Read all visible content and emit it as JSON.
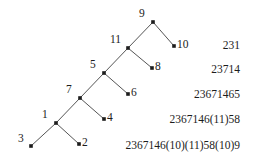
{
  "figure": {
    "kind": "binary-tree-diagram",
    "width": 258,
    "height": 161,
    "background": "#ffffff",
    "ink_color": "#1c1c1c",
    "edge_color": "#555555",
    "node_marker": "filled-square-dot"
  },
  "tree": {
    "nodes": [
      {
        "id": "n9",
        "label": "9",
        "x": 153,
        "y": 22,
        "label_x": 139,
        "label_y": 8,
        "label_side": "left-above"
      },
      {
        "id": "n11",
        "label": "11",
        "x": 128,
        "y": 48,
        "label_x": 110,
        "label_y": 34,
        "label_side": "left-above"
      },
      {
        "id": "n10",
        "label": "10",
        "x": 174,
        "y": 46,
        "label_x": 177,
        "label_y": 39,
        "label_side": "right"
      },
      {
        "id": "n5",
        "label": "5",
        "x": 104,
        "y": 73,
        "label_x": 90,
        "label_y": 59,
        "label_side": "left-above"
      },
      {
        "id": "n8",
        "label": "8",
        "x": 152,
        "y": 68,
        "label_x": 155,
        "label_y": 61,
        "label_side": "right"
      },
      {
        "id": "n7",
        "label": "7",
        "x": 80,
        "y": 98,
        "label_x": 66,
        "label_y": 84,
        "label_side": "left-above"
      },
      {
        "id": "n6",
        "label": "6",
        "x": 128,
        "y": 94,
        "label_x": 131,
        "label_y": 87,
        "label_side": "right"
      },
      {
        "id": "n1",
        "label": "1",
        "x": 56,
        "y": 123,
        "label_x": 42,
        "label_y": 109,
        "label_side": "left-above"
      },
      {
        "id": "n4",
        "label": "4",
        "x": 104,
        "y": 119,
        "label_x": 107,
        "label_y": 112,
        "label_side": "right"
      },
      {
        "id": "n3",
        "label": "3",
        "x": 31,
        "y": 146,
        "label_x": 18,
        "label_y": 133,
        "label_side": "left"
      },
      {
        "id": "n2",
        "label": "2",
        "x": 79,
        "y": 144,
        "label_x": 82,
        "label_y": 137,
        "label_side": "right"
      }
    ],
    "edges": [
      {
        "from": "n9",
        "to": "n11"
      },
      {
        "from": "n9",
        "to": "n10"
      },
      {
        "from": "n11",
        "to": "n5"
      },
      {
        "from": "n11",
        "to": "n8"
      },
      {
        "from": "n5",
        "to": "n7"
      },
      {
        "from": "n5",
        "to": "n6"
      },
      {
        "from": "n7",
        "to": "n1"
      },
      {
        "from": "n7",
        "to": "n4"
      },
      {
        "from": "n1",
        "to": "n3"
      },
      {
        "from": "n1",
        "to": "n2"
      }
    ]
  },
  "codes": [
    {
      "text": "231",
      "x": 240,
      "y": 39
    },
    {
      "text": "23714",
      "x": 240,
      "y": 63
    },
    {
      "text": "23671465",
      "x": 240,
      "y": 88
    },
    {
      "text": "2367146(11)58",
      "x": 240,
      "y": 113
    },
    {
      "text": "2367146(10)(11)58(10)9",
      "x": 240,
      "y": 139
    }
  ]
}
